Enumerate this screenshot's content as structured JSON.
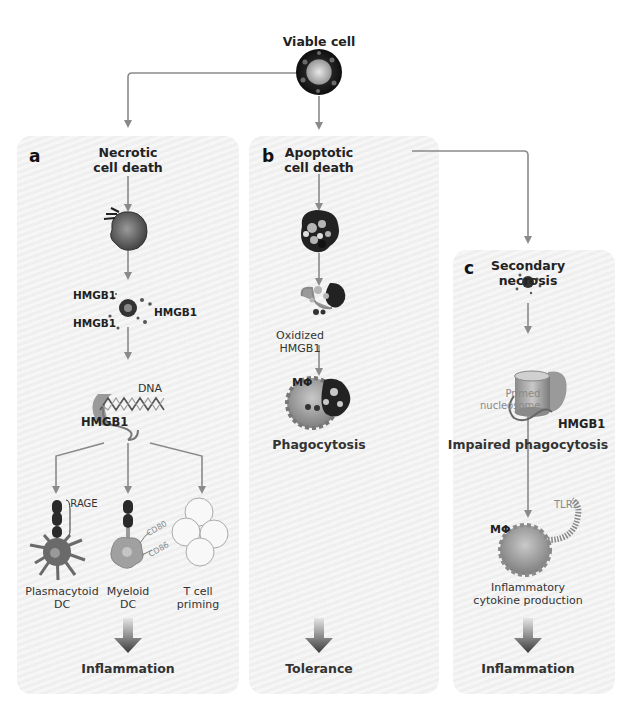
{
  "figure": {
    "root": {
      "label": "Viable cell"
    },
    "panels": [
      {
        "id": "a",
        "letter": "a",
        "title_line1": "Necrotic",
        "title_line2": "cell death",
        "hmgb1_labels": [
          "HMGB1",
          "HMGB1",
          "HMGB1"
        ],
        "dna_label": "DNA",
        "hmgb1_bound_label": "HMGB1",
        "receptor_label": "RAGE",
        "cd_labels": [
          "CD80",
          "CD86"
        ],
        "targets": [
          {
            "line1": "Plasmacytoid",
            "line2": "DC"
          },
          {
            "line1": "Myeloid",
            "line2": "DC"
          },
          {
            "line1": "T cell",
            "line2": "priming"
          }
        ],
        "outcome": "Inflammation"
      },
      {
        "id": "b",
        "letter": "b",
        "title_line1": "Apoptotic",
        "title_line2": "cell death",
        "oxidized_line1": "Oxidized",
        "oxidized_line2": "HMGB1",
        "macrophage_label": "MΦ",
        "process_label": "Phagocytosis",
        "outcome": "Tolerance"
      },
      {
        "id": "c",
        "letter": "c",
        "title_line1": "Secondary",
        "title_line2": "necrosis",
        "nucleosome_line1": "Primed",
        "nucleosome_line2": "nucleosome",
        "hmgb1_label": "HMGB1",
        "process_label": "Impaired phagocytosis",
        "macrophage_label": "MΦ",
        "receptor_label": "TLR2",
        "cytokine_line1": "Inflammatory",
        "cytokine_line2": "cytokine production",
        "outcome": "Inflammation"
      }
    ],
    "colors": {
      "arrow": "#8a8a8a",
      "panel_bg": "#f1f1f1",
      "cell_dark": "#2a2a2a",
      "macrophage": "#9a9a9a",
      "outcome_arrow": "#555555"
    }
  }
}
